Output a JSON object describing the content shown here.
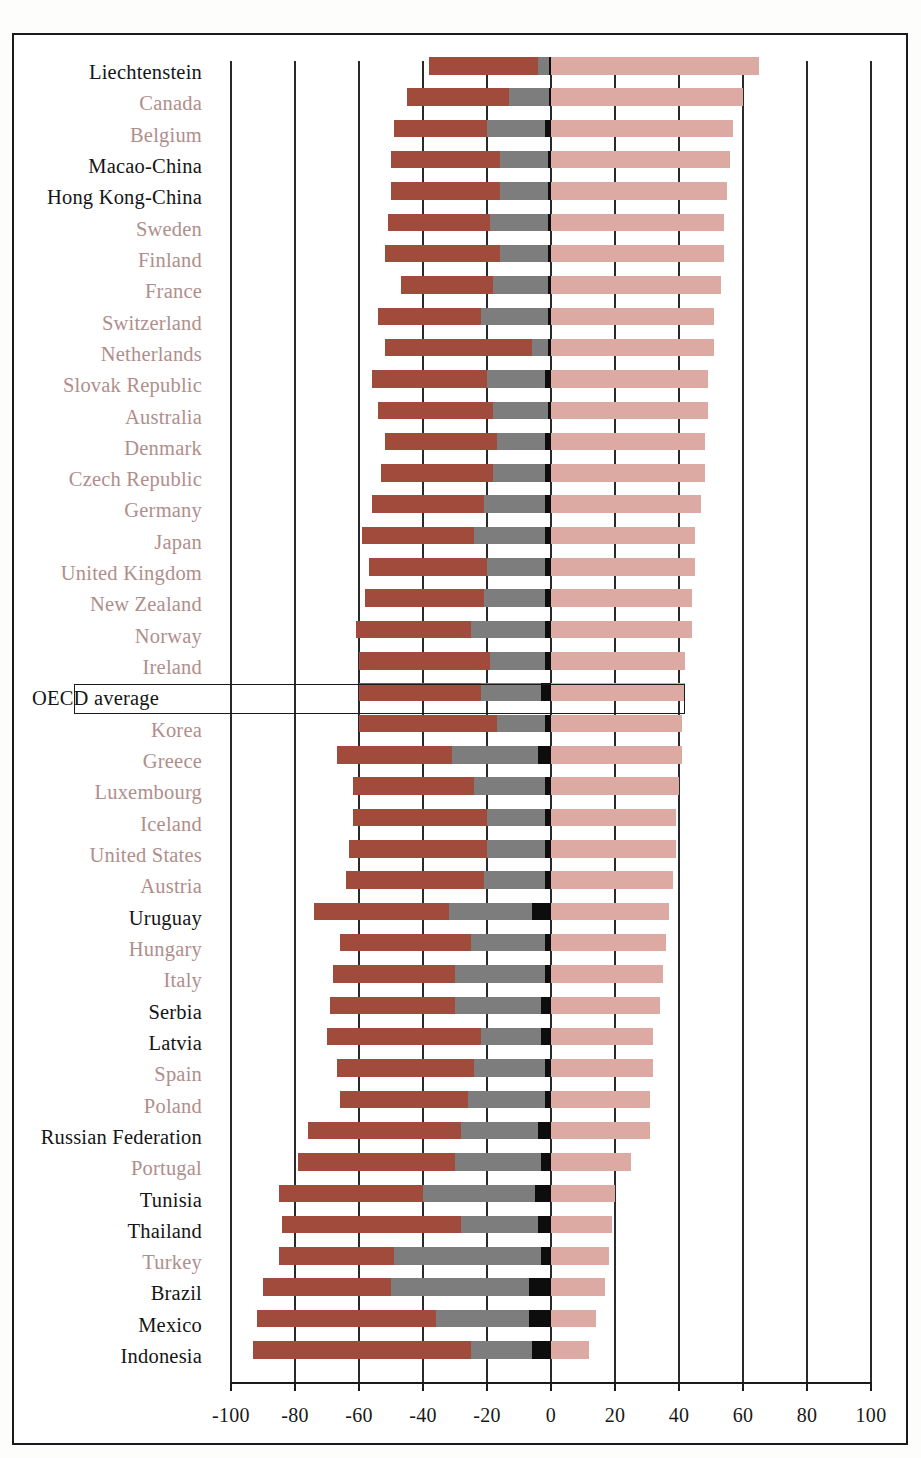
{
  "chart_data": {
    "type": "bar",
    "subtype": "diverging-stacked-horizontal",
    "title": "",
    "xlabel": "",
    "ylabel": "",
    "xlim": [
      -100,
      100
    ],
    "xticks": [
      -100,
      -80,
      -60,
      -40,
      -20,
      0,
      20,
      40,
      60,
      80,
      100
    ],
    "xticklabels": [
      "-100",
      "-80",
      "-60",
      "-40",
      "-20",
      "0",
      "20",
      "40",
      "60",
      "80",
      "100"
    ],
    "grid": true,
    "grid_axis": "x",
    "legend": "none",
    "zero_line": 0,
    "series": [
      {
        "name": "segment-dark-red",
        "color": "#a14b3c"
      },
      {
        "name": "segment-gray",
        "color": "#7d7d7d"
      },
      {
        "name": "segment-black",
        "color": "#0d0d0d"
      },
      {
        "name": "segment-light-pink",
        "color": "#dcaaa3"
      }
    ],
    "categories": [
      "Liechtenstein",
      "Canada",
      "Belgium",
      "Macao-China",
      "Hong Kong-China",
      "Sweden",
      "Finland",
      "France",
      "Switzerland",
      "Netherlands",
      "Slovak Republic",
      "Australia",
      "Denmark",
      "Czech Republic",
      "Germany",
      "Japan",
      "United Kingdom",
      "New Zealand",
      "Norway",
      "Ireland",
      "OECD average",
      "Korea",
      "Greece",
      "Luxembourg",
      "Iceland",
      "United States",
      "Austria",
      "Uruguay",
      "Hungary",
      "Italy",
      "Serbia",
      "Latvia",
      "Spain",
      "Poland",
      "Russian Federation",
      "Portugal",
      "Tunisia",
      "Thailand",
      "Turkey",
      "Brazil",
      "Mexico",
      "Indonesia"
    ],
    "rows": [
      {
        "label": "Liechtenstein",
        "group": "partner",
        "dark_red": [
          -38,
          -4
        ],
        "gray": [
          -4,
          -0.5
        ],
        "black": [
          -0.5,
          0
        ],
        "pink": [
          0,
          65
        ]
      },
      {
        "label": "Canada",
        "group": "oecd",
        "dark_red": [
          -45,
          -13
        ],
        "gray": [
          -13,
          -0.5
        ],
        "black": [
          -0.5,
          0
        ],
        "pink": [
          0,
          60
        ]
      },
      {
        "label": "Belgium",
        "group": "oecd",
        "dark_red": [
          -49,
          -20
        ],
        "gray": [
          -20,
          -2
        ],
        "black": [
          -2,
          0
        ],
        "pink": [
          0,
          57
        ]
      },
      {
        "label": "Macao-China",
        "group": "partner",
        "dark_red": [
          -50,
          -16
        ],
        "gray": [
          -16,
          -1
        ],
        "black": [
          -1,
          0
        ],
        "pink": [
          0,
          56
        ]
      },
      {
        "label": "Hong Kong-China",
        "group": "partner",
        "dark_red": [
          -50,
          -16
        ],
        "gray": [
          -16,
          -1
        ],
        "black": [
          -1,
          0
        ],
        "pink": [
          0,
          55
        ]
      },
      {
        "label": "Sweden",
        "group": "oecd",
        "dark_red": [
          -51,
          -19
        ],
        "gray": [
          -19,
          -1
        ],
        "black": [
          -1,
          0
        ],
        "pink": [
          0,
          54
        ]
      },
      {
        "label": "Finland",
        "group": "oecd",
        "dark_red": [
          -52,
          -16
        ],
        "gray": [
          -16,
          -1
        ],
        "black": [
          -1,
          0
        ],
        "pink": [
          0,
          54
        ]
      },
      {
        "label": "France",
        "group": "oecd",
        "dark_red": [
          -47,
          -18
        ],
        "gray": [
          -18,
          -1
        ],
        "black": [
          -1,
          0
        ],
        "pink": [
          0,
          53
        ]
      },
      {
        "label": "Switzerland",
        "group": "oecd",
        "dark_red": [
          -54,
          -22
        ],
        "gray": [
          -22,
          -1
        ],
        "black": [
          -1,
          0
        ],
        "pink": [
          0,
          51
        ]
      },
      {
        "label": "Netherlands",
        "group": "oecd",
        "dark_red": [
          -52,
          -6
        ],
        "gray": [
          -6,
          -1
        ],
        "black": [
          -1,
          0
        ],
        "pink": [
          0,
          51
        ]
      },
      {
        "label": "Slovak Republic",
        "group": "oecd",
        "dark_red": [
          -56,
          -20
        ],
        "gray": [
          -20,
          -2
        ],
        "black": [
          -2,
          0
        ],
        "pink": [
          0,
          49
        ]
      },
      {
        "label": "Australia",
        "group": "oecd",
        "dark_red": [
          -54,
          -18
        ],
        "gray": [
          -18,
          -1
        ],
        "black": [
          -1,
          0
        ],
        "pink": [
          0,
          49
        ]
      },
      {
        "label": "Denmark",
        "group": "oecd",
        "dark_red": [
          -52,
          -17
        ],
        "gray": [
          -17,
          -2
        ],
        "black": [
          -2,
          0
        ],
        "pink": [
          0,
          48
        ]
      },
      {
        "label": "Czech Republic",
        "group": "oecd",
        "dark_red": [
          -53,
          -18
        ],
        "gray": [
          -18,
          -2
        ],
        "black": [
          -2,
          0
        ],
        "pink": [
          0,
          48
        ]
      },
      {
        "label": "Germany",
        "group": "oecd",
        "dark_red": [
          -56,
          -21
        ],
        "gray": [
          -21,
          -2
        ],
        "black": [
          -2,
          0
        ],
        "pink": [
          0,
          47
        ]
      },
      {
        "label": "Japan",
        "group": "oecd",
        "dark_red": [
          -59,
          -24
        ],
        "gray": [
          -24,
          -2
        ],
        "black": [
          -2,
          0
        ],
        "pink": [
          0,
          45
        ]
      },
      {
        "label": "United Kingdom",
        "group": "oecd",
        "dark_red": [
          -57,
          -20
        ],
        "gray": [
          -20,
          -2
        ],
        "black": [
          -2,
          0
        ],
        "pink": [
          0,
          45
        ]
      },
      {
        "label": "New Zealand",
        "group": "oecd",
        "dark_red": [
          -58,
          -21
        ],
        "gray": [
          -21,
          -2
        ],
        "black": [
          -2,
          0
        ],
        "pink": [
          0,
          44
        ]
      },
      {
        "label": "Norway",
        "group": "oecd",
        "dark_red": [
          -61,
          -25
        ],
        "gray": [
          -25,
          -2
        ],
        "black": [
          -2,
          0
        ],
        "pink": [
          0,
          44
        ]
      },
      {
        "label": "Ireland",
        "group": "oecd",
        "dark_red": [
          -60,
          -19
        ],
        "gray": [
          -19,
          -2
        ],
        "black": [
          -2,
          0
        ],
        "pink": [
          0,
          42
        ]
      },
      {
        "label": "OECD average",
        "group": "average",
        "dark_red": [
          -60,
          -22
        ],
        "gray": [
          -22,
          -3
        ],
        "black": [
          -3,
          0
        ],
        "pink": [
          0,
          42
        ]
      },
      {
        "label": "Korea",
        "group": "oecd",
        "dark_red": [
          -60,
          -17
        ],
        "gray": [
          -17,
          -2
        ],
        "black": [
          -2,
          0
        ],
        "pink": [
          0,
          41
        ]
      },
      {
        "label": "Greece",
        "group": "oecd",
        "dark_red": [
          -67,
          -31
        ],
        "gray": [
          -31,
          -4
        ],
        "black": [
          -4,
          0
        ],
        "pink": [
          0,
          41
        ]
      },
      {
        "label": "Luxembourg",
        "group": "oecd",
        "dark_red": [
          -62,
          -24
        ],
        "gray": [
          -24,
          -2
        ],
        "black": [
          -2,
          0
        ],
        "pink": [
          0,
          40
        ]
      },
      {
        "label": "Iceland",
        "group": "oecd",
        "dark_red": [
          -62,
          -20
        ],
        "gray": [
          -20,
          -2
        ],
        "black": [
          -2,
          0
        ],
        "pink": [
          0,
          39
        ]
      },
      {
        "label": "United States",
        "group": "oecd",
        "dark_red": [
          -63,
          -20
        ],
        "gray": [
          -20,
          -2
        ],
        "black": [
          -2,
          0
        ],
        "pink": [
          0,
          39
        ]
      },
      {
        "label": "Austria",
        "group": "oecd",
        "dark_red": [
          -64,
          -21
        ],
        "gray": [
          -21,
          -2
        ],
        "black": [
          -2,
          0
        ],
        "pink": [
          0,
          38
        ]
      },
      {
        "label": "Uruguay",
        "group": "partner",
        "dark_red": [
          -74,
          -32
        ],
        "gray": [
          -32,
          -6
        ],
        "black": [
          -6,
          0
        ],
        "pink": [
          0,
          37
        ]
      },
      {
        "label": "Hungary",
        "group": "oecd",
        "dark_red": [
          -66,
          -25
        ],
        "gray": [
          -25,
          -2
        ],
        "black": [
          -2,
          0
        ],
        "pink": [
          0,
          36
        ]
      },
      {
        "label": "Italy",
        "group": "oecd",
        "dark_red": [
          -68,
          -30
        ],
        "gray": [
          -30,
          -2
        ],
        "black": [
          -2,
          0
        ],
        "pink": [
          0,
          35
        ]
      },
      {
        "label": "Serbia",
        "group": "partner",
        "dark_red": [
          -69,
          -30
        ],
        "gray": [
          -30,
          -3
        ],
        "black": [
          -3,
          0
        ],
        "pink": [
          0,
          34
        ]
      },
      {
        "label": "Latvia",
        "group": "partner",
        "dark_red": [
          -70,
          -22
        ],
        "gray": [
          -22,
          -3
        ],
        "black": [
          -3,
          0
        ],
        "pink": [
          0,
          32
        ]
      },
      {
        "label": "Spain",
        "group": "oecd",
        "dark_red": [
          -67,
          -24
        ],
        "gray": [
          -24,
          -2
        ],
        "black": [
          -2,
          0
        ],
        "pink": [
          0,
          32
        ]
      },
      {
        "label": "Poland",
        "group": "oecd",
        "dark_red": [
          -66,
          -26
        ],
        "gray": [
          -26,
          -2
        ],
        "black": [
          -2,
          0
        ],
        "pink": [
          0,
          31
        ]
      },
      {
        "label": "Russian Federation",
        "group": "partner",
        "dark_red": [
          -76,
          -28
        ],
        "gray": [
          -28,
          -4
        ],
        "black": [
          -4,
          0
        ],
        "pink": [
          0,
          31
        ]
      },
      {
        "label": "Portugal",
        "group": "oecd",
        "dark_red": [
          -79,
          -30
        ],
        "gray": [
          -30,
          -3
        ],
        "black": [
          -3,
          0
        ],
        "pink": [
          0,
          25
        ]
      },
      {
        "label": "Tunisia",
        "group": "partner",
        "dark_red": [
          -85,
          -40
        ],
        "gray": [
          -40,
          -5
        ],
        "black": [
          -5,
          0
        ],
        "pink": [
          0,
          20
        ]
      },
      {
        "label": "Thailand",
        "group": "partner",
        "dark_red": [
          -84,
          -28
        ],
        "gray": [
          -28,
          -4
        ],
        "black": [
          -4,
          0
        ],
        "pink": [
          0,
          19
        ]
      },
      {
        "label": "Turkey",
        "group": "oecd",
        "dark_red": [
          -85,
          -49
        ],
        "gray": [
          -49,
          -3
        ],
        "black": [
          -3,
          0
        ],
        "pink": [
          0,
          18
        ]
      },
      {
        "label": "Brazil",
        "group": "partner",
        "dark_red": [
          -90,
          -50
        ],
        "gray": [
          -50,
          -7
        ],
        "black": [
          -7,
          0
        ],
        "pink": [
          0,
          17
        ]
      },
      {
        "label": "Mexico",
        "group": "partner",
        "dark_red": [
          -92,
          -36
        ],
        "gray": [
          -36,
          -7
        ],
        "black": [
          -7,
          0
        ],
        "pink": [
          0,
          14
        ]
      },
      {
        "label": "Indonesia",
        "group": "partner",
        "dark_red": [
          -93,
          -25
        ],
        "gray": [
          -25,
          -6
        ],
        "black": [
          -6,
          0
        ],
        "pink": [
          0,
          12
        ]
      }
    ],
    "colors": {
      "dark_red": "#a14b3c",
      "gray": "#7d7d7d",
      "black": "#0d0d0d",
      "light_pink": "#dcaaa3",
      "oecd_label": "#b08e8c",
      "partner_label": "#151515",
      "frame": "#1b1b1b",
      "gridline": "#2a2a2a"
    },
    "highlight": {
      "row": "OECD average",
      "style": "rectangle-outline"
    }
  }
}
